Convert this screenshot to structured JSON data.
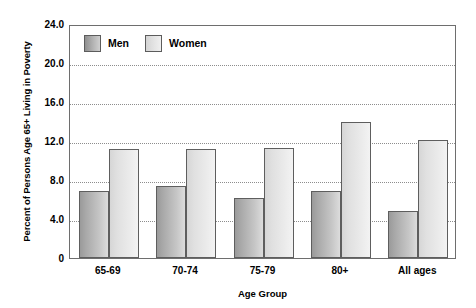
{
  "chart_data": {
    "type": "bar",
    "title": "",
    "xlabel": "Age Group",
    "ylabel": "Percent of Persons Age 65+ Living in Poverty",
    "categories": [
      "65-69",
      "70-74",
      "75-79",
      "80+",
      "All ages"
    ],
    "series": [
      {
        "name": "Men",
        "values": [
          6.9,
          7.4,
          6.2,
          6.9,
          4.8
        ],
        "color": "#b4b4b4"
      },
      {
        "name": "Women",
        "values": [
          11.2,
          11.2,
          11.3,
          14.0,
          12.1
        ],
        "color": "#e4e4e4"
      }
    ],
    "ylim": [
      0,
      24
    ],
    "yticks": [
      "0",
      "4.0",
      "8.0",
      "12.0",
      "16.0",
      "20.0",
      "24.0"
    ],
    "ytick_values": [
      0,
      4,
      8,
      12,
      16,
      20,
      24
    ],
    "grid": true,
    "grid_style": "dotted-horizontal",
    "legend_position": "top-left-inside"
  },
  "legend": {
    "entries": [
      {
        "label": "Men"
      },
      {
        "label": "Women"
      }
    ]
  },
  "axes": {
    "y_title": "Percent of Persons Age 65+ Living in Poverty",
    "x_title": "Age Group"
  }
}
